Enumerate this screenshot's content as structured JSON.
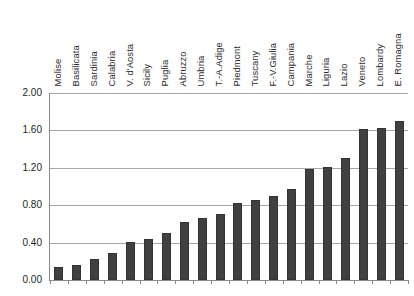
{
  "chart_data": {
    "type": "bar",
    "title": "",
    "subtitle": "",
    "xlabel": "",
    "ylabel": "",
    "ylim": [
      0.0,
      2.0
    ],
    "yticks": [
      "0.00",
      "0.40",
      "0.80",
      "1.20",
      "1.60",
      "2.00"
    ],
    "ytick_values": [
      0.0,
      0.4,
      0.8,
      1.2,
      1.6,
      2.0
    ],
    "grid": true,
    "legend": "none",
    "categories": [
      "Molise",
      "Basilicata",
      "Sardinia",
      "Calabria",
      "V. d'Aosta",
      "Sicily",
      "Puglia",
      "Abruzzo",
      "Umbria",
      "T.-A.Adige",
      "Piedmont",
      "Tuscany",
      "F.-V.Giulia",
      "Campania",
      "Marche",
      "Liguria",
      "Lazio",
      "Veneto",
      "Lombardy",
      "E. Romagna"
    ],
    "values": [
      0.14,
      0.16,
      0.22,
      0.29,
      0.41,
      0.44,
      0.5,
      0.62,
      0.66,
      0.71,
      0.82,
      0.86,
      0.9,
      0.97,
      1.19,
      1.21,
      1.3,
      1.61,
      1.63,
      1.7
    ],
    "bar_color": "#404040",
    "grid_color": "#a6a6a6",
    "axis_color": "#8a8a8a",
    "background": "#ffffff",
    "categories_position": "top-rotated"
  }
}
